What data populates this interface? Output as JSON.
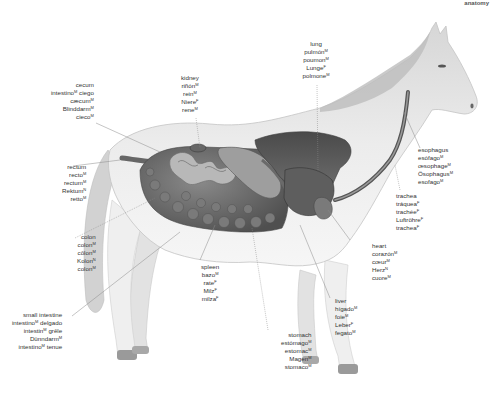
{
  "corner_label": "anatomy",
  "organs": [
    {
      "id": "cecum",
      "terms": [
        {
          "t": "cecum"
        },
        {
          "t": "intestino",
          "g": "M",
          "suffix": " ciego"
        },
        {
          "t": "cæcum",
          "g": "M"
        },
        {
          "t": "Blinddarm",
          "g": "M"
        },
        {
          "t": "cieco",
          "g": "M"
        }
      ]
    },
    {
      "id": "kidney",
      "terms": [
        {
          "t": "kidney"
        },
        {
          "t": "riñón",
          "g": "M"
        },
        {
          "t": "rein",
          "g": "M"
        },
        {
          "t": "Niere",
          "g": "F"
        },
        {
          "t": "rene",
          "g": "M"
        }
      ]
    },
    {
      "id": "lung",
      "terms": [
        {
          "t": "lung"
        },
        {
          "t": "pulmón",
          "g": "M"
        },
        {
          "t": "poumon",
          "g": "M"
        },
        {
          "t": "Lunge",
          "g": "F"
        },
        {
          "t": "polmone",
          "g": "M"
        }
      ]
    },
    {
      "id": "esophagus",
      "terms": [
        {
          "t": "esophagus"
        },
        {
          "t": "esófago",
          "g": "M"
        },
        {
          "t": "œsophage",
          "g": "M"
        },
        {
          "t": "Ösophagus",
          "g": "M"
        },
        {
          "t": "esofago",
          "g": "M"
        }
      ]
    },
    {
      "id": "trachea",
      "terms": [
        {
          "t": "trachea"
        },
        {
          "t": "tráquea",
          "g": "F"
        },
        {
          "t": "trachée",
          "g": "F"
        },
        {
          "t": "Luftröhre",
          "g": "F"
        },
        {
          "t": "trachea",
          "g": "F"
        }
      ]
    },
    {
      "id": "rectum",
      "terms": [
        {
          "t": "rectum"
        },
        {
          "t": "recto",
          "g": "M"
        },
        {
          "t": "rectum",
          "g": "M"
        },
        {
          "t": "Rektum",
          "g": "N"
        },
        {
          "t": "retto",
          "g": "M"
        }
      ]
    },
    {
      "id": "colon",
      "terms": [
        {
          "t": "colon"
        },
        {
          "t": "colon",
          "g": "M"
        },
        {
          "t": "côlon",
          "g": "M"
        },
        {
          "t": "Kolon",
          "g": "N"
        },
        {
          "t": "colon",
          "g": "M"
        }
      ]
    },
    {
      "id": "heart",
      "terms": [
        {
          "t": "heart"
        },
        {
          "t": "corazón",
          "g": "M"
        },
        {
          "t": "cœur",
          "g": "M"
        },
        {
          "t": "Herz",
          "g": "N"
        },
        {
          "t": "cuore",
          "g": "M"
        }
      ]
    },
    {
      "id": "spleen",
      "terms": [
        {
          "t": "spleen"
        },
        {
          "t": "bazo",
          "g": "M"
        },
        {
          "t": "rate",
          "g": "F"
        },
        {
          "t": "Milz",
          "g": "F"
        },
        {
          "t": "milza",
          "g": "F"
        }
      ]
    },
    {
      "id": "small_intestine",
      "terms": [
        {
          "t": "small intestine"
        },
        {
          "t": "intestino",
          "g": "M",
          "suffix": " delgado"
        },
        {
          "t": "intestin",
          "g": "M",
          "suffix": " grêle"
        },
        {
          "t": "Dünndarm",
          "g": "M"
        },
        {
          "t": "intestino",
          "g": "M",
          "suffix": " tenue"
        }
      ]
    },
    {
      "id": "liver",
      "terms": [
        {
          "t": "liver"
        },
        {
          "t": "hígado",
          "g": "M"
        },
        {
          "t": "foie",
          "g": "M"
        },
        {
          "t": "Leber",
          "g": "F"
        },
        {
          "t": "fegato",
          "g": "M"
        }
      ]
    },
    {
      "id": "stomach",
      "terms": [
        {
          "t": "stomach"
        },
        {
          "t": "estómago",
          "g": "M"
        },
        {
          "t": "estomac",
          "g": "M"
        },
        {
          "t": "Magen",
          "g": "M"
        },
        {
          "t": "stomaco",
          "g": "M"
        }
      ]
    }
  ],
  "colors": {
    "label_text": "#333333",
    "leader_line": "#8a8a8a",
    "horse_body": "#e8e8e8",
    "organs_dark": "#5a5a5a"
  }
}
